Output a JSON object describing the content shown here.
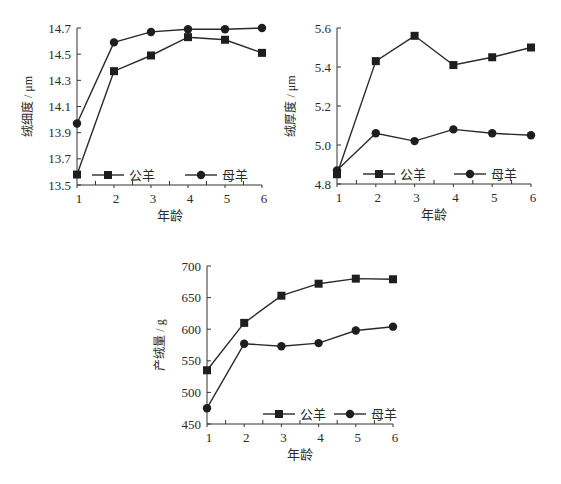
{
  "chart_data": [
    {
      "type": "line",
      "title": "",
      "xlabel": "年龄",
      "ylabel": "绒细度 / μm",
      "x": [
        1,
        2,
        3,
        4,
        5,
        6
      ],
      "ylim": [
        13.5,
        14.7
      ],
      "yticks": [
        13.5,
        13.7,
        13.9,
        14.1,
        14.3,
        14.5,
        14.7
      ],
      "ytick_labels": [
        "13.5",
        "13.7",
        "13.9",
        "14.1",
        "14.3",
        "14.5",
        "14.7"
      ],
      "series": [
        {
          "name": "公羊",
          "marker": "square",
          "values": [
            13.58,
            14.37,
            14.49,
            14.63,
            14.61,
            14.51
          ]
        },
        {
          "name": "母羊",
          "marker": "circle",
          "values": [
            13.97,
            14.59,
            14.67,
            14.69,
            14.69,
            14.7
          ]
        }
      ],
      "legend_position": "bottom-inside",
      "grid": false
    },
    {
      "type": "line",
      "title": "",
      "xlabel": "年龄",
      "ylabel": "绒厚度 / μm",
      "x": [
        1,
        2,
        3,
        4,
        5,
        6
      ],
      "ylim": [
        4.8,
        5.6
      ],
      "yticks": [
        4.8,
        5.0,
        5.2,
        5.4,
        5.6
      ],
      "ytick_labels": [
        "4.8",
        "5.0",
        "5.2",
        "5.4",
        "5.6"
      ],
      "series": [
        {
          "name": "公羊",
          "marker": "square",
          "values": [
            4.85,
            5.43,
            5.56,
            5.41,
            5.45,
            5.5
          ]
        },
        {
          "name": "母羊",
          "marker": "circle",
          "values": [
            4.87,
            5.06,
            5.02,
            5.08,
            5.06,
            5.05
          ]
        }
      ],
      "legend_position": "bottom-inside",
      "grid": false
    },
    {
      "type": "line",
      "title": "",
      "xlabel": "年龄",
      "ylabel": "产绒量 / g",
      "x": [
        1,
        2,
        3,
        4,
        5,
        6
      ],
      "ylim": [
        450,
        700
      ],
      "yticks": [
        450,
        500,
        550,
        600,
        650,
        700
      ],
      "ytick_labels": [
        "450",
        "500",
        "550",
        "600",
        "650",
        "700"
      ],
      "series": [
        {
          "name": "公羊",
          "marker": "square",
          "values": [
            535,
            610,
            653,
            672,
            680,
            679
          ]
        },
        {
          "name": "母羊",
          "marker": "circle",
          "values": [
            475,
            577,
            573,
            578,
            598,
            604
          ]
        }
      ],
      "legend_position": "bottom-right-inside",
      "grid": false
    }
  ],
  "layout": [
    {
      "x0": 77,
      "x1": 262,
      "y_top": 28,
      "y_bottom": 185,
      "ylabel_x": 32,
      "legend": {
        "x": 92,
        "y": 175,
        "gap": 93
      }
    },
    {
      "x0": 337,
      "x1": 531,
      "y_top": 28,
      "y_bottom": 184,
      "ylabel_x": 295,
      "legend": {
        "x": 363,
        "y": 174,
        "gap": 91
      }
    },
    {
      "x0": 207,
      "x1": 393,
      "y_top": 266,
      "y_bottom": 424,
      "ylabel_x": 164,
      "legend": {
        "x": 263,
        "y": 414,
        "gap": 71
      }
    }
  ]
}
